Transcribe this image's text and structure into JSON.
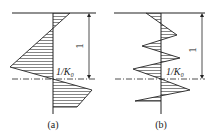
{
  "figures": [
    {
      "id": "a",
      "caption": "(a)",
      "level_label": "1/K₀",
      "dimension_label": "1"
    },
    {
      "id": "b",
      "caption": "(b)",
      "level_label": "1/K₀",
      "dimension_label": "1"
    }
  ],
  "colors": {
    "line": "#222222",
    "background": "#ffffff"
  }
}
